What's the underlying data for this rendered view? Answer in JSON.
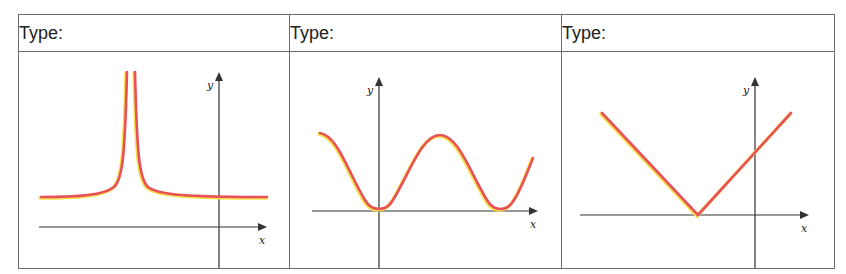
{
  "table": {
    "columns": [
      {
        "header": "Type:",
        "graph": "Graph 1"
      },
      {
        "header": "Type:",
        "graph": "Graph 2"
      },
      {
        "header": "Type:",
        "graph": "Graph 3"
      }
    ]
  },
  "axes": {
    "x_label": "x",
    "y_label": "y"
  },
  "colors": {
    "curve": "#e8505a",
    "curve_edge": "#f6e04a",
    "axis": "#333333",
    "border": "#6e6e6e"
  },
  "chart_data": [
    {
      "type": "line",
      "title": "Type:",
      "description": "Vertical asymptote left of y-axis; horizontal asymptote above x-axis (curve shaped like y = 1/(x-a)^2 + c)",
      "xlabel": "x",
      "ylabel": "y",
      "axes": {
        "origin": [
          200,
          175
        ],
        "x_from": 20,
        "x_to": 248,
        "y_from": 240,
        "y_to": 20
      },
      "curve_path": "M22,145 C60,145 85,143 95,135 C104,127 106,100 108,20 M116,20 C118,100 120,127 129,135 C139,143 170,145 248,145",
      "grid": false
    },
    {
      "type": "line",
      "title": "Type:",
      "description": "Periodic wave touching x-axis at origin and further right (cosine-like, y = 1 - cos x)",
      "xlabel": "x",
      "ylabel": "y",
      "axes": {
        "origin": [
          89,
          159
        ],
        "x_from": 22,
        "x_to": 248,
        "y_from": 237,
        "y_to": 25
      },
      "curve_path": "M30,81 C48,84 58,120 75,148 C82,160 96,160 103,148 C120,120 132,83 150,83 C168,83 180,120 197,148 C204,160 217,160 224,148 C232,136 238,118 243,106",
      "grid": false
    },
    {
      "type": "line",
      "title": "Type:",
      "description": "Absolute value V shape with vertex on negative x-axis (y = |x + a|)",
      "xlabel": "x",
      "ylabel": "y",
      "axes": {
        "origin": [
          193,
          163
        ],
        "x_from": 18,
        "x_to": 247,
        "y_from": 246,
        "y_to": 25
      },
      "curve_path": "M40,61 L136,163 L229,61",
      "grid": false
    }
  ]
}
